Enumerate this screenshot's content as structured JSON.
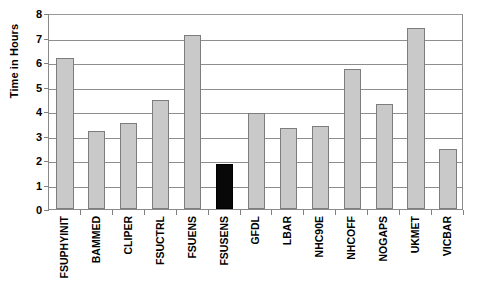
{
  "chart_data": {
    "type": "bar",
    "title": "",
    "xlabel": "",
    "ylabel": "Time in Hours",
    "ylim": [
      0,
      8
    ],
    "ytick_step": 1,
    "yticks": [
      8,
      7,
      6,
      5,
      4,
      3,
      2,
      1,
      0
    ],
    "grid": true,
    "legend_position": "none",
    "categories": [
      "FSUPHYINIT",
      "BAMMED",
      "CLIPER",
      "FSUCTRL",
      "FSUENS",
      "FSUSENS",
      "GFDL",
      "LBAR",
      "NHC90E",
      "NHCOFF",
      "NOGAPS",
      "UKMET",
      "VICBAR"
    ],
    "values": [
      6.15,
      3.2,
      3.5,
      4.45,
      7.1,
      1.85,
      3.9,
      3.3,
      3.4,
      5.7,
      4.3,
      7.4,
      2.45
    ],
    "highlighted_category": "FSUSENS",
    "colors": {
      "bar_fill": "#c9c9c9",
      "bar_border": "#7d7d7d",
      "bar_fill_highlight": "#080808",
      "bar_border_highlight": "#000000",
      "gridline": "#8e8e8e",
      "axis": "#8a8a8a",
      "text": "#000000",
      "background": "#ffffff"
    }
  },
  "axis": {
    "y_title": "Time in Hours"
  }
}
